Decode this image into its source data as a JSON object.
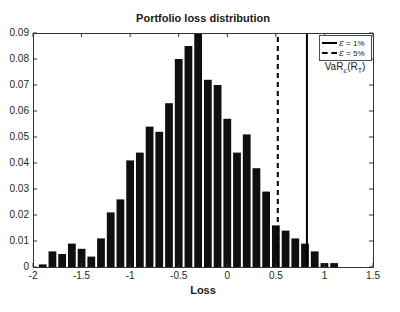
{
  "figure": {
    "title": "Portfolio loss distribution",
    "x_axis_label": "Loss",
    "legend": {
      "entries": [
        {
          "symbol": "ε",
          "rest": " = 1%",
          "style": "solid"
        },
        {
          "symbol": "ε",
          "rest": " = 5%",
          "style": "dashed"
        }
      ],
      "annotation": {
        "base": "VaR",
        "base_sub": "ε",
        "arg_open": "(R",
        "arg_sub": "T",
        "arg_close": ")"
      }
    },
    "colors": {
      "bar_fill": "#0f0f0f",
      "axis": "#333333",
      "text": "#1a1a1a",
      "var_line": "#000000",
      "background": "#ffffff"
    }
  },
  "chart_data": {
    "type": "bar",
    "subtype": "histogram",
    "title": "Portfolio loss distribution",
    "xlabel": "Loss",
    "ylabel": "",
    "xlim": [
      -2,
      1.5
    ],
    "ylim": [
      0,
      0.09
    ],
    "xticks": [
      -2,
      -1.5,
      -1,
      -0.5,
      0,
      0.5,
      1,
      1.5
    ],
    "xtick_labels": [
      "-2",
      "-1.5",
      "-1",
      "-0.5",
      "0",
      "0.5",
      "1",
      "1.5"
    ],
    "yticks": [
      0,
      0.01,
      0.02,
      0.03,
      0.04,
      0.05,
      0.06,
      0.07,
      0.08,
      0.09
    ],
    "ytick_labels": [
      "0",
      "0.01",
      "0.02",
      "0.03",
      "0.04",
      "0.05",
      "0.06",
      "0.07",
      "0.08",
      "0.09"
    ],
    "grid": false,
    "legend_position": "top-right",
    "bin_width": 0.1,
    "bar_visual_width": 0.08,
    "bar_centers": [
      -1.9,
      -1.8,
      -1.7,
      -1.6,
      -1.5,
      -1.4,
      -1.3,
      -1.2,
      -1.1,
      -1.0,
      -0.9,
      -0.8,
      -0.7,
      -0.6,
      -0.5,
      -0.4,
      -0.3,
      -0.2,
      -0.1,
      0.0,
      0.1,
      0.2,
      0.3,
      0.4,
      0.5,
      0.6,
      0.7,
      0.8,
      0.9,
      1.0,
      1.1
    ],
    "bar_heights": [
      0.001,
      0.006,
      0.005,
      0.009,
      0.007,
      0.004,
      0.011,
      0.021,
      0.026,
      0.041,
      0.044,
      0.054,
      0.052,
      0.063,
      0.08,
      0.085,
      0.09,
      0.072,
      0.07,
      0.057,
      0.044,
      0.051,
      0.038,
      0.029,
      0.016,
      0.014,
      0.011,
      0.009,
      0.006,
      0.0015,
      0.0015
    ],
    "vlines": [
      {
        "x": 0.82,
        "style": "solid",
        "legend_label": "ε = 1%",
        "name": "var-line-1pct"
      },
      {
        "x": 0.52,
        "style": "dashed",
        "legend_label": "ε = 5%",
        "name": "var-line-5pct"
      }
    ],
    "annotation": "VaR_ε(R_T)"
  }
}
